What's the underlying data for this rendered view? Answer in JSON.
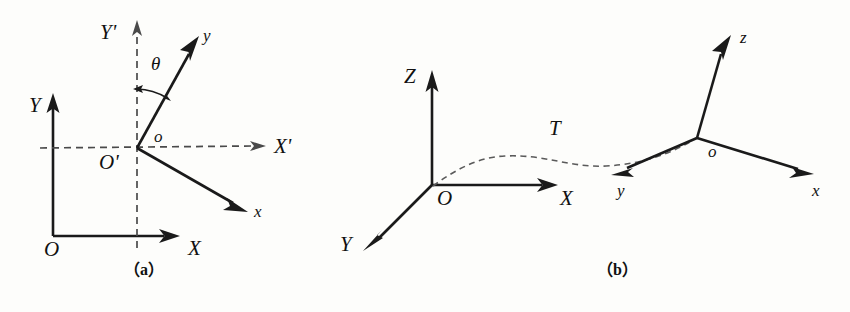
{
  "figure": {
    "width": 850,
    "height": 312,
    "background_color": "#fdfdfb",
    "ink_color": "#1a1a1a",
    "dashed_color": "#4a4a4a"
  },
  "panel_a": {
    "caption": "（a）",
    "labels": {
      "origin_global": "O",
      "axis_global_x": "X",
      "axis_global_y": "Y",
      "origin_local": "O'",
      "origin_local_alt": "o",
      "axis_translated_x": "X'",
      "axis_translated_y": "Y'",
      "axis_local_x": "x",
      "axis_local_y": "y",
      "rotation_angle": "θ"
    }
  },
  "panel_b": {
    "caption": "（b）",
    "labels": {
      "origin_global": "O",
      "axis_global_x": "X",
      "axis_global_y": "Y",
      "axis_global_z": "Z",
      "origin_local": "o",
      "axis_local_x": "x",
      "axis_local_y": "y",
      "axis_local_z": "z",
      "transform": "T"
    }
  }
}
